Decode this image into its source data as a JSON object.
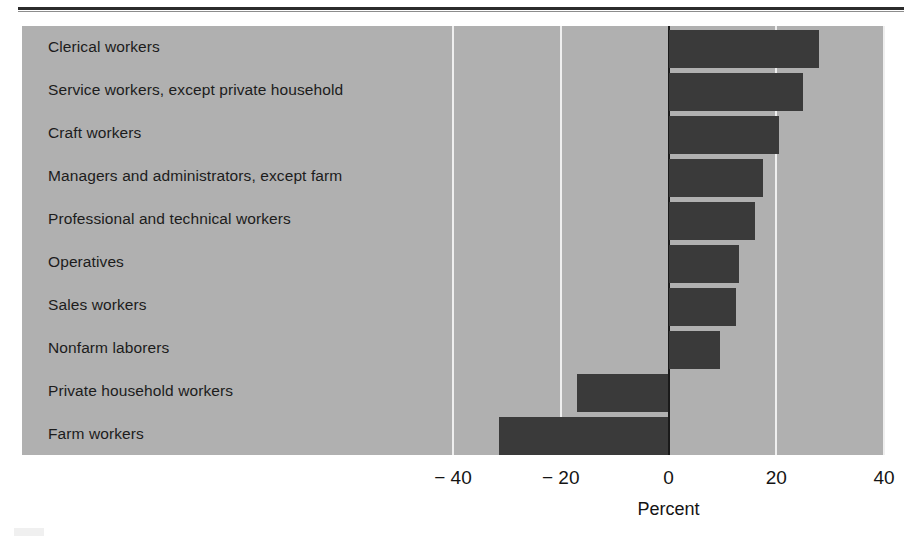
{
  "figure": {
    "axis_title": "Percent",
    "colors": {
      "panel_background": "#b0b0b0",
      "bar": "#3a3a3a",
      "gridline": "#efefef",
      "zero_axis": "#1a1a1a",
      "text": "#1c1c1c"
    }
  },
  "chart_data": {
    "type": "bar",
    "orientation": "horizontal",
    "title": "",
    "subtitle": "",
    "xlabel": "Percent",
    "ylabel": "",
    "xlim": [
      -40,
      40
    ],
    "xticks": [
      -40,
      -20,
      0,
      20,
      40
    ],
    "xtick_labels": [
      "− 40",
      "− 20",
      "0",
      "20",
      "40"
    ],
    "grid": true,
    "gridlines_at": [
      -40,
      -20,
      20,
      40
    ],
    "legend": null,
    "categories": [
      "Clerical workers",
      "Service workers, except private household",
      "Craft workers",
      "Managers and administrators, except farm",
      "Professional and technical workers",
      "Operatives",
      "Sales workers",
      "Nonfarm laborers",
      "Private household workers",
      "Farm workers"
    ],
    "values": [
      27.9,
      25.0,
      20.5,
      17.5,
      16.0,
      13.0,
      12.5,
      9.5,
      -17.0,
      -31.5
    ]
  }
}
